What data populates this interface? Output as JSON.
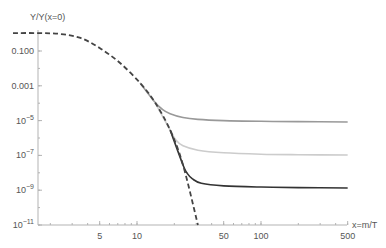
{
  "chart_data": {
    "type": "line",
    "title": "",
    "xlabel": "x=m/T",
    "ylabel": "Y/Y(x=0)",
    "xscale": "log",
    "yscale": "log",
    "xlim": [
      1,
      500
    ],
    "ylim": [
      1e-11,
      1
    ],
    "grid": false,
    "legend": null,
    "x_ticks": [
      {
        "value": 5,
        "label": "5"
      },
      {
        "value": 10,
        "label": "10"
      },
      {
        "value": 50,
        "label": "50"
      },
      {
        "value": 100,
        "label": "100"
      },
      {
        "value": 500,
        "label": "500"
      }
    ],
    "y_ticks": [
      {
        "value": 0.1,
        "label": "0.100",
        "exp": null
      },
      {
        "value": 0.001,
        "label": "0.001",
        "exp": null
      },
      {
        "value": 1e-05,
        "label": "10",
        "exp": "−5"
      },
      {
        "value": 1e-07,
        "label": "10",
        "exp": "−7"
      },
      {
        "value": 1e-09,
        "label": "10",
        "exp": "−9"
      },
      {
        "value": 1e-11,
        "label": "10",
        "exp": "−11"
      }
    ],
    "series": [
      {
        "name": "equilibrium",
        "style": "dashed",
        "color": "#444444",
        "x": [
          1.0,
          1.6,
          2.4,
          3.5,
          5.0,
          7.3,
          10.6,
          13.9,
          18.5,
          23.5,
          31.0
        ],
        "log10_y": [
          0.03,
          0.03,
          -0.02,
          -0.25,
          -0.83,
          -1.69,
          -2.84,
          -3.93,
          -5.54,
          -7.55,
          -11.0
        ]
      },
      {
        "name": "freeze-out (upper)",
        "style": "solid",
        "color": "#999999",
        "x": [
          10.6,
          13.9,
          16.0,
          18.5,
          23.5,
          31.0,
          50,
          100,
          200,
          500
        ],
        "log10_y": [
          -2.84,
          -3.93,
          -4.35,
          -4.6,
          -4.82,
          -4.93,
          -5.0,
          -5.04,
          -5.06,
          -5.08
        ]
      },
      {
        "name": "freeze-out (middle)",
        "style": "solid",
        "color": "#cccccc",
        "x": [
          13.9,
          18.5,
          20.5,
          23.5,
          31.0,
          50,
          100,
          200,
          500
        ],
        "log10_y": [
          -3.93,
          -5.54,
          -6.1,
          -6.45,
          -6.7,
          -6.85,
          -6.93,
          -6.96,
          -6.98
        ]
      },
      {
        "name": "freeze-out (lower)",
        "style": "solid",
        "color": "#333333",
        "x": [
          18.5,
          23.5,
          25.5,
          28.0,
          33.0,
          50,
          100,
          200,
          500
        ],
        "log10_y": [
          -5.54,
          -7.55,
          -8.05,
          -8.35,
          -8.6,
          -8.75,
          -8.82,
          -8.85,
          -8.87
        ]
      }
    ]
  },
  "plot": {
    "px_left": 15,
    "px_right": 347,
    "px_top": 30,
    "px_bottom": 225,
    "y_axis_px": 38,
    "x_origin_px": 13,
    "px_per_decade_x": 124,
    "y_ref_px": 51,
    "y_ref_log": -1,
    "px_per_decade_y": 17.4
  }
}
